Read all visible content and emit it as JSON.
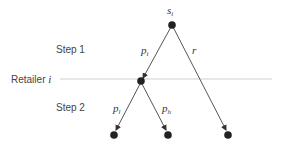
{
  "diagram": {
    "type": "decision-tree",
    "steps": [
      {
        "label": "Step 1"
      },
      {
        "label": "Step 2"
      }
    ],
    "divider": {
      "label": "Retailer",
      "label_var": "i"
    },
    "nodes": {
      "root": {
        "label": "s",
        "sub": "i"
      },
      "retailer": {
        "label": ""
      },
      "leaf_left": {
        "label": ""
      },
      "leaf_mid": {
        "label": ""
      },
      "leaf_right": {
        "label": ""
      }
    },
    "edges": [
      {
        "from": "root",
        "to": "retailer",
        "label": "p",
        "sub": "i"
      },
      {
        "from": "root",
        "to": "leaf_right",
        "label": "r",
        "sub": ""
      },
      {
        "from": "retailer",
        "to": "leaf_left",
        "label": "p",
        "sub": "l"
      },
      {
        "from": "retailer",
        "to": "leaf_mid",
        "label": "p",
        "sub": "h"
      }
    ],
    "colors": {
      "node": "#222222",
      "edge": "#444444",
      "divider": "#cccccc"
    }
  }
}
